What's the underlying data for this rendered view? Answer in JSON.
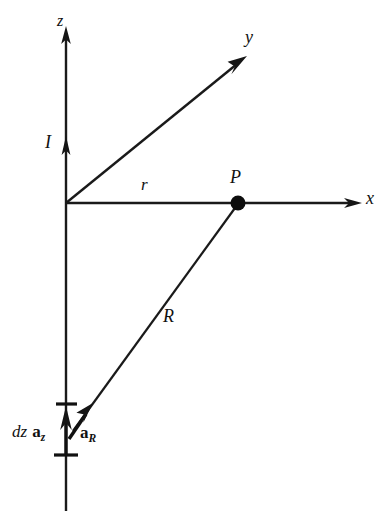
{
  "figure": {
    "background_color": "#ffffff",
    "ink_color": "#111111",
    "width": 385,
    "height": 521
  },
  "axes": [
    {
      "name": "z-axis",
      "label": "z",
      "from": [
        66,
        510
      ],
      "to": [
        66,
        30
      ],
      "arrow": "up",
      "label_pos": [
        57,
        13
      ]
    },
    {
      "name": "y-axis",
      "label": "y",
      "from": [
        66,
        203
      ],
      "to": [
        246,
        57
      ],
      "arrow": "up-right",
      "label_pos": [
        245,
        28
      ]
    },
    {
      "name": "x-axis",
      "label": "x",
      "from": [
        66,
        203
      ],
      "to": [
        361,
        203
      ],
      "arrow": "right",
      "label_pos": [
        366,
        189
      ]
    }
  ],
  "origin": [
    66,
    203
  ],
  "points": [
    {
      "name": "field-point-P",
      "label": "P",
      "pos": [
        238,
        203
      ],
      "radius": 7,
      "label_pos": [
        230,
        168
      ]
    }
  ],
  "vectors": [
    {
      "name": "current-I",
      "label": "I",
      "description": "current direction arrow on z-axis",
      "arrow_at": [
        66,
        142
      ],
      "label_pos": [
        45,
        133
      ]
    },
    {
      "name": "distance-r",
      "label": "r",
      "description": "radial distance from z-axis to point P along x",
      "from": [
        66,
        203
      ],
      "to": [
        238,
        203
      ],
      "label_pos": [
        141,
        176
      ]
    },
    {
      "name": "distance-R",
      "label": "R",
      "description": "vector from source element dz to field point P",
      "from": [
        72,
        432
      ],
      "to": [
        234,
        209
      ],
      "label_pos": [
        163,
        307
      ]
    },
    {
      "name": "unit-vector-aR",
      "label_prefix": "a",
      "label_subscript": "R",
      "label": "a_R",
      "description": "unit vector pointing from source element toward P",
      "from": [
        70,
        437
      ],
      "to": [
        92,
        404
      ],
      "label_pos": [
        80,
        424
      ]
    },
    {
      "name": "source-element-dz-az",
      "label_italic": "dz",
      "label_prefix": "a",
      "label_subscript": "z",
      "label": "dz a_z",
      "description": "differential current element along z",
      "from": [
        66,
        452
      ],
      "to": [
        66,
        408
      ],
      "label_pos": [
        12,
        423
      ]
    }
  ],
  "tick_marks": [
    {
      "name": "dz-upper-tick",
      "x1": 56,
      "x2": 77,
      "y": 404
    },
    {
      "name": "dz-lower-tick",
      "x1": 54,
      "x2": 78,
      "y": 455
    }
  ],
  "labels": {
    "z": "z",
    "y": "y",
    "x": "x",
    "I": "I",
    "r": "r",
    "P": "P",
    "R": "R",
    "dz": "dz",
    "a": "a",
    "sub_z": "z",
    "sub_R": "R"
  }
}
